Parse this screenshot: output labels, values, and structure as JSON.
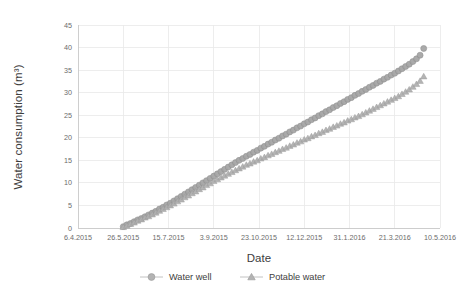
{
  "chart_data": {
    "type": "scatter",
    "title": "",
    "xlabel": "Date",
    "ylabel": "Water consumption (m³)",
    "grid": true,
    "legend_position": "bottom",
    "ylim": [
      0,
      45
    ],
    "yticks": [
      "0",
      "5",
      "10",
      "15",
      "20",
      "25",
      "30",
      "35",
      "40",
      "45"
    ],
    "ytick_values": [
      0,
      5,
      10,
      15,
      20,
      25,
      30,
      35,
      40,
      45
    ],
    "xticks": [
      "6.4.2015",
      "26.5.2015",
      "15.7.2015",
      "3.9.2015",
      "23.10.2015",
      "12.12.2015",
      "31.1.2016",
      "21.3.2016",
      "10.5.2016"
    ],
    "xtick_days": [
      0,
      50,
      100,
      150,
      200,
      250,
      300,
      350,
      400
    ],
    "xlim_days": [
      0,
      400
    ],
    "series": [
      {
        "name": "Water well",
        "marker": "circle",
        "color": "#a6a6a6",
        "x": [
          50,
          54,
          58,
          62,
          66,
          70,
          74,
          78,
          82,
          86,
          90,
          94,
          98,
          102,
          106,
          110,
          114,
          118,
          122,
          126,
          130,
          134,
          138,
          142,
          146,
          150,
          154,
          158,
          162,
          166,
          170,
          174,
          178,
          182,
          186,
          190,
          194,
          198,
          202,
          206,
          210,
          214,
          218,
          222,
          226,
          230,
          234,
          238,
          242,
          246,
          250,
          254,
          258,
          262,
          266,
          270,
          274,
          278,
          282,
          286,
          290,
          294,
          298,
          302,
          306,
          310,
          314,
          318,
          322,
          326,
          330,
          334,
          338,
          342,
          346,
          350,
          354,
          358,
          362,
          366,
          370,
          374,
          378,
          382
        ],
        "y": [
          0.3,
          0.7,
          1.0,
          1.4,
          1.8,
          2.1,
          2.5,
          2.9,
          3.3,
          3.7,
          4.2,
          4.6,
          5.1,
          5.5,
          6.0,
          6.5,
          7.0,
          7.5,
          8.0,
          8.5,
          9.0,
          9.5,
          10.0,
          10.5,
          11.0,
          11.5,
          12.0,
          12.5,
          13.0,
          13.5,
          14.0,
          14.5,
          15.0,
          15.4,
          15.9,
          16.3,
          16.8,
          17.2,
          17.7,
          18.1,
          18.6,
          19.0,
          19.5,
          19.9,
          20.4,
          20.8,
          21.3,
          21.7,
          22.2,
          22.6,
          23.1,
          23.5,
          24.0,
          24.4,
          24.9,
          25.3,
          25.8,
          26.2,
          26.7,
          27.1,
          27.6,
          28.0,
          28.5,
          28.9,
          29.4,
          29.8,
          30.3,
          30.7,
          31.2,
          31.6,
          32.1,
          32.5,
          33.0,
          33.4,
          33.9,
          34.3,
          34.8,
          35.3,
          35.8,
          36.3,
          36.9,
          37.5,
          38.3,
          39.8
        ]
      },
      {
        "name": "Potable water",
        "marker": "triangle",
        "color": "#b0b0b0",
        "x": [
          50,
          54,
          58,
          62,
          66,
          70,
          74,
          78,
          82,
          86,
          90,
          94,
          98,
          102,
          106,
          110,
          114,
          118,
          122,
          126,
          130,
          134,
          138,
          142,
          146,
          150,
          154,
          158,
          162,
          166,
          170,
          174,
          178,
          182,
          186,
          190,
          194,
          198,
          202,
          206,
          210,
          214,
          218,
          222,
          226,
          230,
          234,
          238,
          242,
          246,
          250,
          254,
          258,
          262,
          266,
          270,
          274,
          278,
          282,
          286,
          290,
          294,
          298,
          302,
          306,
          310,
          314,
          318,
          322,
          326,
          330,
          334,
          338,
          342,
          346,
          350,
          354,
          358,
          362,
          366,
          370,
          374,
          378,
          382
        ],
        "y": [
          0.2,
          0.5,
          0.9,
          1.2,
          1.6,
          1.9,
          2.3,
          2.6,
          3.0,
          3.4,
          3.8,
          4.2,
          4.6,
          5.0,
          5.4,
          5.9,
          6.3,
          6.8,
          7.2,
          7.7,
          8.1,
          8.6,
          9.0,
          9.5,
          9.9,
          10.4,
          10.8,
          11.2,
          11.6,
          12.0,
          12.4,
          12.8,
          13.2,
          13.6,
          14.0,
          14.3,
          14.7,
          15.0,
          15.4,
          15.7,
          16.1,
          16.4,
          16.8,
          17.1,
          17.5,
          17.8,
          18.2,
          18.5,
          18.9,
          19.2,
          19.6,
          19.9,
          20.3,
          20.6,
          21.0,
          21.3,
          21.7,
          22.0,
          22.4,
          22.7,
          23.1,
          23.4,
          23.8,
          24.1,
          24.5,
          24.8,
          25.2,
          25.6,
          26.0,
          26.4,
          26.8,
          27.2,
          27.6,
          28.0,
          28.4,
          28.8,
          29.2,
          29.7,
          30.2,
          30.7,
          31.3,
          31.9,
          32.6,
          33.6
        ]
      }
    ]
  }
}
